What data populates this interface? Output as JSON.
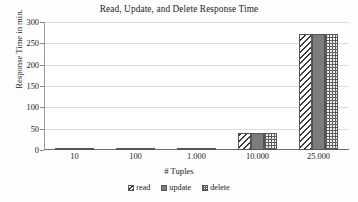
{
  "chart_data": {
    "type": "bar",
    "title": "Read, Update, and Delete Response Time",
    "xlabel": "# Tuples",
    "ylabel": "Response Time in min.",
    "categories": [
      "10",
      "100",
      "1.000",
      "10.000",
      "25.000"
    ],
    "series": [
      {
        "name": "read",
        "values": [
          0.5,
          0.6,
          1.0,
          40,
          272
        ]
      },
      {
        "name": "update",
        "values": [
          0.5,
          0.6,
          1.0,
          40,
          272
        ]
      },
      {
        "name": "delete",
        "values": [
          0.5,
          0.6,
          1.0,
          39,
          272
        ]
      }
    ],
    "ylim": [
      0,
      300
    ],
    "yticks": [
      0,
      50,
      100,
      150,
      200,
      250,
      300
    ],
    "ytick_labels": [
      "0",
      "50",
      "100",
      "150",
      "200",
      "250",
      "300"
    ],
    "grid": true,
    "legend_position": "bottom",
    "legend_entries": [
      "read",
      "update",
      "delete"
    ],
    "colors": {
      "read": "#ffffff",
      "update": "#7c7c7c",
      "delete": "#f2f2f2",
      "outline": "#555555",
      "gridline": "#dcdcdc",
      "axis": "#6d6d6d",
      "text": "#232323",
      "background": "#ffffff"
    }
  }
}
